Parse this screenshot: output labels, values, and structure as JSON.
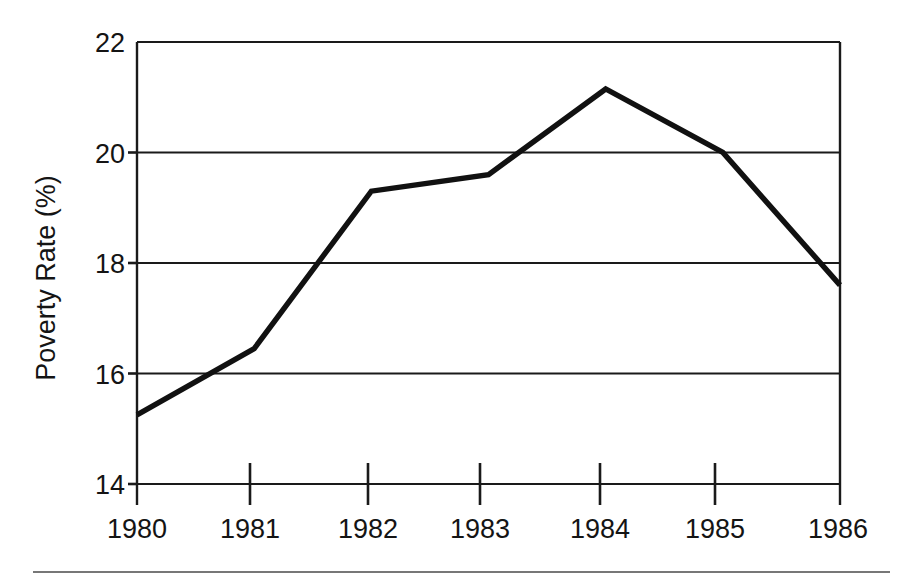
{
  "chart_data": {
    "type": "line",
    "title": "",
    "subtitle": "",
    "xlabel": "",
    "ylabel": "Poverty Rate (%)",
    "categories": [
      "1980",
      "1981",
      "1982",
      "1983",
      "1984",
      "1985",
      "1986"
    ],
    "x": [
      1980,
      1981,
      1982,
      1983,
      1984,
      1985,
      1986
    ],
    "values": [
      15.25,
      16.45,
      19.3,
      19.6,
      21.15,
      20.0,
      17.6
    ],
    "series": [
      {
        "name": "Poverty Rate",
        "values": [
          15.25,
          16.45,
          19.3,
          19.6,
          21.15,
          20.0,
          17.6
        ]
      }
    ],
    "ylim": [
      14,
      22
    ],
    "xlim": [
      1980,
      1986
    ],
    "ytick_labels": [
      "14",
      "16",
      "18",
      "20",
      "22"
    ],
    "ytick_values": [
      14,
      16,
      18,
      20,
      22
    ],
    "xtick_labels": [
      "1980",
      "1981",
      "1982",
      "1983",
      "1984",
      "1985",
      "1986"
    ],
    "grid": "horizontal",
    "legend": "none",
    "line_color": "#111111",
    "frame_color": "#1a1a1a",
    "background_color": "#ffffff",
    "annotations": []
  },
  "axis": {
    "y_title": "Poverty Rate (%)",
    "y_labels": {
      "t0": "14",
      "t1": "16",
      "t2": "18",
      "t3": "20",
      "t4": "22"
    },
    "x_labels": {
      "t0": "1980",
      "t1": "1981",
      "t2": "1982",
      "t3": "1983",
      "t4": "1984",
      "t5": "1985",
      "t6": "1986"
    }
  }
}
